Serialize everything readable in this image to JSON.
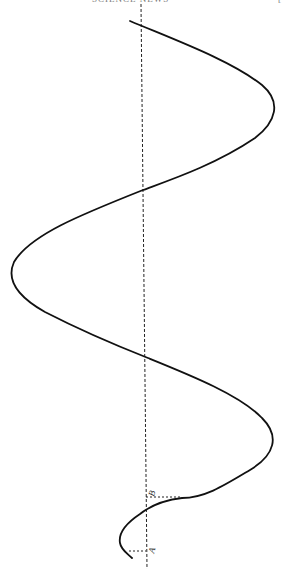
{
  "header": {
    "running_title": "SCIENCE NEWS",
    "page_mark": "["
  },
  "figure": {
    "axis": {
      "x": 144,
      "y_top": 4,
      "y_bottom": 569,
      "style": "dashed"
    },
    "labels": [
      {
        "id": "B",
        "text": "B",
        "x": 149,
        "y": 496
      },
      {
        "id": "A",
        "text": "A",
        "x": 149,
        "y": 552
      }
    ],
    "markers": [
      {
        "id": "B",
        "y": 497,
        "x_from": 146,
        "x_to": 182
      },
      {
        "id": "A",
        "y": 551,
        "x_from": 128,
        "x_to": 146
      }
    ],
    "curve_color": "#111111"
  }
}
